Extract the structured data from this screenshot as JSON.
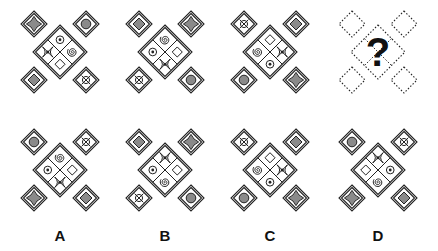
{
  "puzzle": {
    "question_mark": "?",
    "colors": {
      "stroke": "#222222",
      "fill_gray": "#8a8a8a",
      "background": "#ffffff"
    },
    "icons": {
      "star": "four-point-star-icon",
      "circle": "filled-circle-icon",
      "diamond": "filled-diamond-icon",
      "target": "crossed-circle-target-icon",
      "dot": "dot-in-circle-icon",
      "spiral": "spiral-icon",
      "hourglass": "bowtie-hourglass-icon",
      "empty": "empty-square-icon"
    },
    "sequence": [
      {
        "corners": {
          "tl": "star",
          "tr": "circle",
          "bl": "diamond",
          "br": "target"
        },
        "center": {
          "top": "dot",
          "right": "spiral",
          "bottom": "empty",
          "left": "hourglass"
        }
      },
      {
        "corners": {
          "tl": "diamond",
          "tr": "star",
          "bl": "target",
          "br": "circle"
        },
        "center": {
          "top": "spiral",
          "right": "empty",
          "bottom": "hourglass",
          "left": "dot"
        }
      },
      {
        "corners": {
          "tl": "target",
          "tr": "diamond",
          "bl": "circle",
          "br": "star"
        },
        "center": {
          "top": "empty",
          "right": "hourglass",
          "bottom": "dot",
          "left": "spiral"
        }
      },
      {
        "unknown": true
      }
    ],
    "options": [
      {
        "label": "A",
        "corners": {
          "tl": "circle",
          "tr": "target",
          "bl": "star",
          "br": "diamond"
        },
        "center": {
          "top": "spiral",
          "right": "empty",
          "bottom": "hourglass",
          "left": "dot"
        }
      },
      {
        "label": "B",
        "corners": {
          "tl": "diamond",
          "tr": "star",
          "bl": "target",
          "br": "circle"
        },
        "center": {
          "top": "hourglass",
          "right": "empty",
          "bottom": "spiral",
          "left": "dot"
        }
      },
      {
        "label": "C",
        "corners": {
          "tl": "target",
          "tr": "diamond",
          "bl": "circle",
          "br": "star"
        },
        "center": {
          "top": "empty",
          "right": "hourglass",
          "bottom": "dot",
          "left": "spiral"
        }
      },
      {
        "label": "D",
        "corners": {
          "tl": "circle",
          "tr": "target",
          "bl": "star",
          "br": "diamond"
        },
        "center": {
          "top": "hourglass",
          "right": "dot",
          "bottom": "spiral",
          "left": "empty"
        }
      }
    ]
  }
}
